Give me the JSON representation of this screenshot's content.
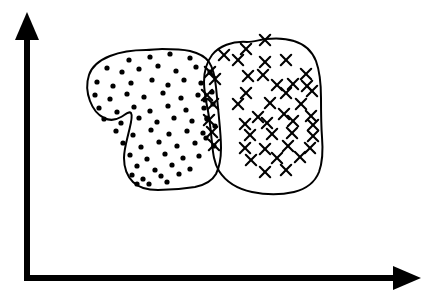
{
  "figure": {
    "title": "Two overlapping class clusters in feature space",
    "background_color": "#ffffff",
    "ink_color": "#000000",
    "width": 438,
    "height": 300
  },
  "axes": {
    "origin": {
      "x": 27,
      "y": 278
    },
    "x_axis": {
      "label": "",
      "name": "horizontal-axis",
      "from": {
        "x": 27,
        "y": 278
      },
      "to": {
        "x": 400,
        "y": 278
      },
      "arrow_tip": {
        "x": 421,
        "y": 278
      },
      "stroke_width": 6,
      "color": "#000000"
    },
    "y_axis": {
      "label": "",
      "name": "vertical-axis",
      "from": {
        "x": 27,
        "y": 278
      },
      "to": {
        "x": 27,
        "y": 35
      },
      "arrow_tip": {
        "x": 27,
        "y": 12
      },
      "stroke_width": 6,
      "color": "#000000"
    }
  },
  "chart_data": {
    "type": "scatter",
    "title": "Two overlapping class clusters in feature space",
    "xlabel": "",
    "ylabel": "",
    "xlim": [
      27,
      421
    ],
    "ylim": [
      278,
      12
    ],
    "grid": false,
    "legend": "none",
    "annotations": [],
    "series": [
      {
        "name": "class-dot",
        "marker": "dot",
        "color": "#000000",
        "marker_size": 2.6,
        "count": 73,
        "points": [
          [
            129,
            60
          ],
          [
            150,
            57
          ],
          [
            170,
            54
          ],
          [
            190,
            58
          ],
          [
            107,
            68
          ],
          [
            122,
            72
          ],
          [
            139,
            69
          ],
          [
            158,
            66
          ],
          [
            176,
            71
          ],
          [
            196,
            67
          ],
          [
            210,
            72
          ],
          [
            97,
            82
          ],
          [
            113,
            86
          ],
          [
            131,
            83
          ],
          [
            152,
            80
          ],
          [
            168,
            85
          ],
          [
            184,
            80
          ],
          [
            201,
            83
          ],
          [
            95,
            95
          ],
          [
            110,
            99
          ],
          [
            127,
            94
          ],
          [
            144,
            97
          ],
          [
            163,
            93
          ],
          [
            181,
            98
          ],
          [
            198,
            95
          ],
          [
            212,
            92
          ],
          [
            99,
            108
          ],
          [
            117,
            112
          ],
          [
            134,
            107
          ],
          [
            150,
            111
          ],
          [
            168,
            106
          ],
          [
            186,
            110
          ],
          [
            204,
            108
          ],
          [
            104,
            119
          ],
          [
            121,
            123
          ],
          [
            139,
            118
          ],
          [
            157,
            122
          ],
          [
            174,
            118
          ],
          [
            192,
            121
          ],
          [
            207,
            119
          ],
          [
            116,
            131
          ],
          [
            133,
            135
          ],
          [
            151,
            130
          ],
          [
            169,
            134
          ],
          [
            187,
            131
          ],
          [
            203,
            133
          ],
          [
            123,
            143
          ],
          [
            141,
            147
          ],
          [
            159,
            142
          ],
          [
            177,
            146
          ],
          [
            195,
            143
          ],
          [
            130,
            155
          ],
          [
            147,
            159
          ],
          [
            165,
            154
          ],
          [
            183,
            158
          ],
          [
            199,
            156
          ],
          [
            137,
            166
          ],
          [
            155,
            170
          ],
          [
            172,
            165
          ],
          [
            190,
            169
          ],
          [
            132,
            175
          ],
          [
            143,
            179
          ],
          [
            161,
            176
          ],
          [
            179,
            174
          ],
          [
            137,
            184
          ],
          [
            149,
            184
          ],
          [
            167,
            182
          ],
          [
            205,
            100
          ],
          [
            213,
            104
          ],
          [
            207,
            118
          ],
          [
            215,
            126
          ],
          [
            206,
            138
          ],
          [
            214,
            146
          ]
        ]
      },
      {
        "name": "class-cross",
        "marker": "x",
        "color": "#000000",
        "marker_size": 5.2,
        "count": 45,
        "points": [
          [
            265,
            40
          ],
          [
            246,
            49
          ],
          [
            224,
            55
          ],
          [
            238,
            60
          ],
          [
            265,
            62
          ],
          [
            286,
            60
          ],
          [
            248,
            76
          ],
          [
            263,
            75
          ],
          [
            306,
            74
          ],
          [
            277,
            85
          ],
          [
            293,
            84
          ],
          [
            307,
            86
          ],
          [
            246,
            93
          ],
          [
            286,
            93
          ],
          [
            312,
            91
          ],
          [
            238,
            104
          ],
          [
            270,
            103
          ],
          [
            301,
            104
          ],
          [
            258,
            117
          ],
          [
            284,
            114
          ],
          [
            311,
            116
          ],
          [
            245,
            124
          ],
          [
            267,
            123
          ],
          [
            293,
            121
          ],
          [
            313,
            125
          ],
          [
            250,
            135
          ],
          [
            272,
            134
          ],
          [
            292,
            133
          ],
          [
            313,
            136
          ],
          [
            245,
            148
          ],
          [
            265,
            149
          ],
          [
            288,
            146
          ],
          [
            310,
            148
          ],
          [
            251,
            160
          ],
          [
            277,
            158
          ],
          [
            300,
            157
          ],
          [
            265,
            172
          ],
          [
            286,
            170
          ],
          [
            210,
            72
          ],
          [
            215,
            79
          ],
          [
            207,
            95
          ],
          [
            213,
            104
          ],
          [
            209,
            120
          ],
          [
            212,
            132
          ],
          [
            214,
            145
          ]
        ]
      }
    ],
    "clusters": [
      {
        "name": "dot-cluster-boundary",
        "label": "",
        "class": "class-dot",
        "fill": "none",
        "stroke": "#000000",
        "stroke_width": 2
      },
      {
        "name": "cross-cluster-boundary",
        "label": "",
        "class": "class-cross",
        "fill": "none",
        "stroke": "#000000",
        "stroke_width": 2
      }
    ],
    "overlap_region": {
      "name": "overlap-lens",
      "description": "Region where the dot cluster and cross cluster boundaries intersect; contains both dot and cross markers.",
      "approx_x_range": [
        200,
        222
      ],
      "approx_y_range": [
        62,
        150
      ]
    }
  }
}
